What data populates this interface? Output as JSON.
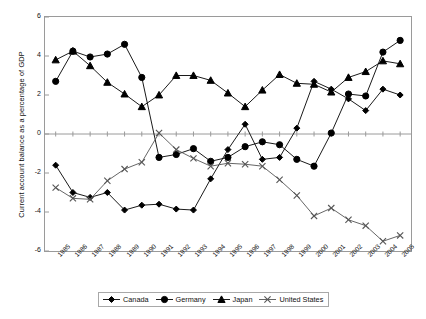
{
  "chart_data": {
    "type": "line",
    "title": "",
    "xlabel": "",
    "ylabel": "Current account balance as a percentage of GDP",
    "ylim": [
      -6,
      6
    ],
    "yticks": [
      6,
      4,
      2,
      0,
      -2,
      -4,
      -6
    ],
    "grid": false,
    "legend_position": "bottom",
    "categories": [
      "1985",
      "1986",
      "1987",
      "1988",
      "1989",
      "1990",
      "1991",
      "1992",
      "1993",
      "1994",
      "1995",
      "1996",
      "1997",
      "1998",
      "1999",
      "2000",
      "2001",
      "2002",
      "2003",
      "2004",
      "2005"
    ],
    "series": [
      {
        "name": "Canada",
        "marker": "diamond",
        "color": "#000000",
        "values": [
          -1.6,
          -3.0,
          -3.25,
          -3.0,
          -3.9,
          -3.65,
          -3.6,
          -3.85,
          -3.9,
          -2.3,
          -0.8,
          0.5,
          -1.3,
          -1.2,
          0.3,
          2.7,
          2.3,
          1.8,
          1.2,
          2.3,
          2.0
        ]
      },
      {
        "name": "Germany",
        "marker": "circle",
        "color": "#000000",
        "values": [
          2.7,
          4.25,
          3.95,
          4.1,
          4.6,
          2.9,
          -1.2,
          -1.05,
          -0.75,
          -1.4,
          -1.2,
          -0.65,
          -0.4,
          -0.55,
          -1.3,
          -1.65,
          0.05,
          2.05,
          1.95,
          4.2,
          4.8
        ]
      },
      {
        "name": "Japan",
        "marker": "triangle",
        "color": "#000000",
        "values": [
          3.8,
          4.25,
          3.5,
          2.65,
          2.05,
          1.4,
          2.0,
          3.0,
          3.0,
          2.75,
          2.1,
          1.4,
          2.25,
          3.05,
          2.6,
          2.55,
          2.15,
          2.9,
          3.2,
          3.75,
          3.6
        ]
      },
      {
        "name": "United States",
        "marker": "cross",
        "color": "#555555",
        "values": [
          -2.75,
          -3.3,
          -3.35,
          -2.4,
          -1.8,
          -1.45,
          0.05,
          -0.8,
          -1.25,
          -1.65,
          -1.5,
          -1.55,
          -1.65,
          -2.35,
          -3.15,
          -4.2,
          -3.8,
          -4.4,
          -4.7,
          -5.5,
          -5.2
        ]
      }
    ]
  },
  "legend": {
    "items": [
      {
        "label": "Canada"
      },
      {
        "label": "Germany"
      },
      {
        "label": "Japan"
      },
      {
        "label": "United States"
      }
    ]
  }
}
